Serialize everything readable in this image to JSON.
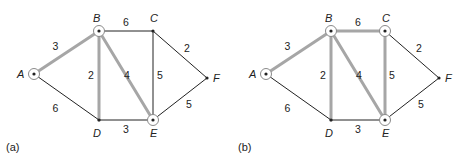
{
  "colors": {
    "thin_edge": "#222222",
    "highlight_edge": "#a6a6a6",
    "node": "#222222",
    "circle": "#8a8a8a"
  },
  "graphs": [
    {
      "caption": "(a)",
      "offset_x": 0,
      "nodes": [
        {
          "id": "A",
          "label": "A",
          "x": 34,
          "y": 74,
          "circled": true
        },
        {
          "id": "B",
          "label": "B",
          "x": 99,
          "y": 31,
          "circled": true
        },
        {
          "id": "C",
          "label": "C",
          "x": 153,
          "y": 31,
          "circled": false
        },
        {
          "id": "D",
          "label": "D",
          "x": 99,
          "y": 120,
          "circled": false
        },
        {
          "id": "E",
          "label": "E",
          "x": 153,
          "y": 120,
          "circled": true
        },
        {
          "id": "F",
          "label": "F",
          "x": 207,
          "y": 78,
          "circled": false
        }
      ],
      "edges": [
        {
          "from": "A",
          "to": "B",
          "weight": "3",
          "highlight": true
        },
        {
          "from": "A",
          "to": "D",
          "weight": "6",
          "highlight": false
        },
        {
          "from": "B",
          "to": "C",
          "weight": "6",
          "highlight": false
        },
        {
          "from": "B",
          "to": "D",
          "weight": "2",
          "highlight": true
        },
        {
          "from": "B",
          "to": "E",
          "weight": "4",
          "highlight": true
        },
        {
          "from": "C",
          "to": "E",
          "weight": "5",
          "highlight": false
        },
        {
          "from": "C",
          "to": "F",
          "weight": "2",
          "highlight": false
        },
        {
          "from": "D",
          "to": "E",
          "weight": "3",
          "highlight": false
        },
        {
          "from": "E",
          "to": "F",
          "weight": "5",
          "highlight": false
        }
      ]
    },
    {
      "caption": "(b)",
      "offset_x": 232,
      "nodes": [
        {
          "id": "A",
          "label": "A",
          "x": 34,
          "y": 74,
          "circled": true
        },
        {
          "id": "B",
          "label": "B",
          "x": 99,
          "y": 31,
          "circled": true
        },
        {
          "id": "C",
          "label": "C",
          "x": 153,
          "y": 31,
          "circled": true
        },
        {
          "id": "D",
          "label": "D",
          "x": 99,
          "y": 120,
          "circled": false
        },
        {
          "id": "E",
          "label": "E",
          "x": 153,
          "y": 120,
          "circled": true
        },
        {
          "id": "F",
          "label": "F",
          "x": 207,
          "y": 78,
          "circled": false
        }
      ],
      "edges": [
        {
          "from": "A",
          "to": "B",
          "weight": "3",
          "highlight": true
        },
        {
          "from": "A",
          "to": "D",
          "weight": "6",
          "highlight": false
        },
        {
          "from": "B",
          "to": "C",
          "weight": "6",
          "highlight": true
        },
        {
          "from": "B",
          "to": "D",
          "weight": "2",
          "highlight": true
        },
        {
          "from": "B",
          "to": "E",
          "weight": "4",
          "highlight": true
        },
        {
          "from": "C",
          "to": "E",
          "weight": "5",
          "highlight": true
        },
        {
          "from": "C",
          "to": "F",
          "weight": "2",
          "highlight": false
        },
        {
          "from": "D",
          "to": "E",
          "weight": "3",
          "highlight": false
        },
        {
          "from": "E",
          "to": "F",
          "weight": "5",
          "highlight": false
        }
      ]
    }
  ]
}
